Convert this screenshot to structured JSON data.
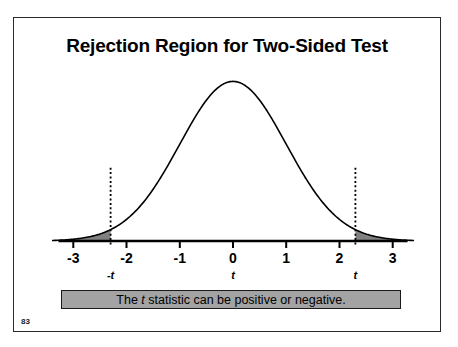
{
  "slide": {
    "title": "Rejection Region for Two-Sided Test",
    "page_number": "83",
    "border_color": "#2a2a2a"
  },
  "caption": {
    "text_before": "The ",
    "italic_symbol": "t",
    "text_after": " statistic can be positive or negative.",
    "full_text": "The t statistic can be positive or negative.",
    "fill_color": "#a3a3a3",
    "border_color": "#1a1a1a"
  },
  "chart_data": {
    "type": "line",
    "title": "Rejection Region for Two-Sided Test",
    "subtitle": "",
    "xlabel": "",
    "ylabel": "",
    "grid": false,
    "legend": "none",
    "distribution": "standard normal / t density",
    "xlim": [
      -3.4,
      3.4
    ],
    "ylim": [
      0,
      0.42
    ],
    "x_tick_values": [
      -3,
      -2,
      -1,
      0,
      1,
      2,
      3
    ],
    "x_tick_labels": [
      "-3",
      "-2",
      "-1",
      "0",
      "1",
      "2",
      "3"
    ],
    "critical_values": [
      -2.3,
      2.3
    ],
    "critical_labels": [
      "-t",
      "t"
    ],
    "center_label": "t",
    "center_label_x": 0,
    "shaded_regions": [
      {
        "name": "left-rejection-region",
        "from": -3.4,
        "to": -2.3,
        "fill": "#808080"
      },
      {
        "name": "right-rejection-region",
        "from": 2.3,
        "to": 3.4,
        "fill": "#808080"
      }
    ],
    "curve_color": "#000000",
    "axis_color": "#000000",
    "dotted_line_color": "#000000",
    "x": [
      -3.4,
      -3.2,
      -3.0,
      -2.8,
      -2.6,
      -2.4,
      -2.2,
      -2.0,
      -1.8,
      -1.6,
      -1.4,
      -1.2,
      -1.0,
      -0.8,
      -0.6,
      -0.4,
      -0.2,
      0.0,
      0.2,
      0.4,
      0.6,
      0.8,
      1.0,
      1.2,
      1.4,
      1.6,
      1.8,
      2.0,
      2.2,
      2.4,
      2.6,
      2.8,
      3.0,
      3.2,
      3.4
    ],
    "y": [
      0.0012,
      0.0024,
      0.0044,
      0.0079,
      0.0136,
      0.0224,
      0.0355,
      0.054,
      0.079,
      0.1109,
      0.1497,
      0.1942,
      0.242,
      0.2897,
      0.3332,
      0.3683,
      0.391,
      0.3989,
      0.391,
      0.3683,
      0.3332,
      0.2897,
      0.242,
      0.1942,
      0.1497,
      0.1109,
      0.079,
      0.054,
      0.0355,
      0.0224,
      0.0136,
      0.0079,
      0.0044,
      0.0024,
      0.0012
    ]
  }
}
